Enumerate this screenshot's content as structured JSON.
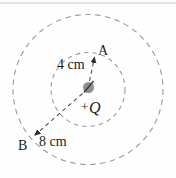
{
  "diagram": {
    "charge": {
      "sign": "+",
      "symbol": "Q"
    },
    "points": {
      "a_label": "A",
      "b_label": "B"
    },
    "radii": {
      "inner_label": "4 cm",
      "outer_label": "8 cm"
    },
    "colors": {
      "background": "#fefefe",
      "circle_dash": "#9b9b9b",
      "radius_line": "#4d4d4d",
      "arrowhead": "#2e2e2e",
      "charge_fill": "#8f8f8f",
      "charge_slash": "#3d3d3d",
      "text": "#1c1c1c",
      "top_rule": "#cacaca"
    }
  }
}
